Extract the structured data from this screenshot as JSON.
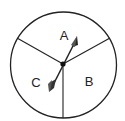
{
  "spinner": {
    "sections": [
      {
        "label": "A",
        "x": 64,
        "y": 37
      },
      {
        "label": "B",
        "x": 89,
        "y": 83
      },
      {
        "label": "C",
        "x": 36,
        "y": 84
      }
    ],
    "colors": {
      "stroke": "#222222",
      "fill": "#ffffff"
    }
  }
}
